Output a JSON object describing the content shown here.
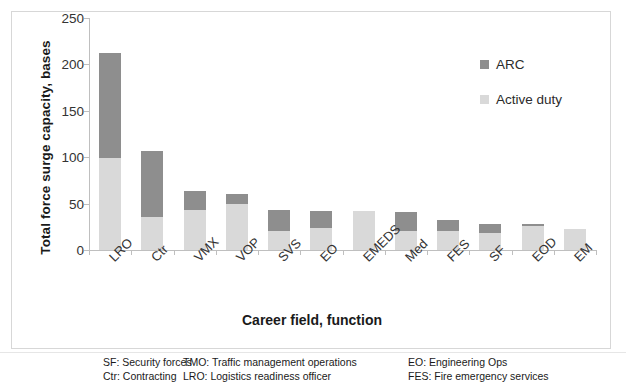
{
  "chart_data": {
    "type": "bar",
    "subtype": "stacked-vertical",
    "title": "",
    "xlabel": "Career field, function",
    "ylabel": "Total force surge capacity, bases",
    "categories": [
      "LRO",
      "Ctr",
      "VMX",
      "VOP",
      "SVS",
      "EO",
      "EMEDS",
      "Med",
      "FES",
      "SF",
      "EOD",
      "EM"
    ],
    "series": [
      {
        "name": "Active duty",
        "color": "#d9d9d9",
        "values": [
          99,
          36,
          43,
          50,
          21,
          24,
          42,
          21,
          20,
          18,
          26,
          23
        ]
      },
      {
        "name": "ARC",
        "color": "#8e8e8e",
        "values": [
          113,
          71,
          21,
          10,
          22,
          18,
          0,
          20,
          12,
          10,
          2,
          0
        ]
      }
    ],
    "totals": [
      212,
      107,
      64,
      60,
      43,
      42,
      42,
      41,
      32,
      28,
      28,
      23
    ],
    "ylim": [
      0,
      250
    ],
    "yticks": [
      0,
      50,
      100,
      150,
      200,
      250
    ],
    "ytick_labels": [
      "0",
      "50",
      "100",
      "150",
      "200",
      "250"
    ],
    "grid": false,
    "legend_position": "top-right",
    "stack_order": [
      "Active duty",
      "ARC"
    ]
  },
  "legend": {
    "entries": [
      {
        "label": "ARC",
        "color": "#8e8e8e"
      },
      {
        "label": "Active duty",
        "color": "#d9d9d9"
      }
    ]
  },
  "key": {
    "col1": [
      "SF: Security forces",
      "Ctr: Contracting"
    ],
    "col2": [
      "TMO: Traffic management operations",
      "LRO: Logistics readiness officer"
    ],
    "col3": [
      "EO: Engineering Ops",
      "FES: Fire emergency services"
    ]
  }
}
